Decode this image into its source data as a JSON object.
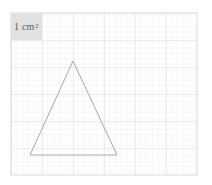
{
  "figure": {
    "background_color": "#ffffff"
  },
  "unit_label": {
    "text": "1 cm",
    "exponent": "2",
    "full_text": "1 cm²",
    "background_color": "#e2e2e2",
    "text_color": "#5e5e5e"
  },
  "chart_data": {
    "type": "scatter",
    "xlabel": "",
    "ylabel": "",
    "grid": true,
    "legend_position": "none",
    "grid_spec": {
      "origin_x": 11,
      "origin_y": 13,
      "major_cell_px": 31,
      "major_cell_py": 27,
      "columns": 6,
      "rows": 6,
      "minor_divisions_per_cell": 5,
      "major_color": "#d8d8d8",
      "minor_color": "#ececec",
      "unit_label": "1 cm²"
    },
    "shapes": [
      {
        "name": "triangle",
        "type": "polygon",
        "stroke": "#a8a8a8",
        "stroke_width": 1,
        "fill": "none",
        "points_px": [
          [
            73,
            61
          ],
          [
            117,
            155
          ],
          [
            30,
            155
          ]
        ],
        "points_grid_cm": [
          [
            2.0,
            4.22
          ],
          [
            3.42,
            0.74
          ],
          [
            0.61,
            0.74
          ]
        ],
        "base_cm": 2.81,
        "height_cm": 3.48,
        "area_cm2": 4.89
      }
    ]
  }
}
